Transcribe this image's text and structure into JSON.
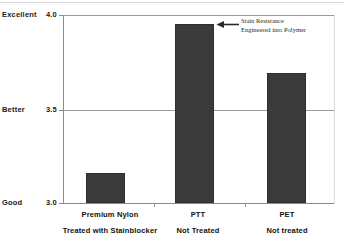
{
  "chart_data": {
    "type": "bar",
    "title": "",
    "subtitle": "",
    "xlabel": "",
    "ylabel": "",
    "ylim": [
      3.0,
      4.0
    ],
    "grid": true,
    "legend": "none",
    "categories": [
      "Premium Nylon Treated with Stainblocker",
      "PTT Not Treated",
      "PET Not treated"
    ],
    "values": [
      3.16,
      3.95,
      3.69
    ],
    "bar_color": "#3a3a3a",
    "y_ticks": [
      {
        "value": 3.0,
        "number_label": "3.0",
        "qualitative_label": "Good"
      },
      {
        "value": 3.5,
        "number_label": "3.5",
        "qualitative_label": "Better"
      },
      {
        "value": 4.0,
        "number_label": "4.0",
        "qualitative_label": "Excellent"
      }
    ],
    "category_labels": [
      {
        "line1": "Premium Nylon",
        "line2": "Treated with Stainblocker"
      },
      {
        "line1": "PTT",
        "line2": "Not Treated"
      },
      {
        "line1": "PET",
        "line2": "Not treated"
      }
    ],
    "annotations": [
      {
        "line1": "Stain Resistance",
        "line2": "Engineered into Polymer",
        "points_to": "PTT Not Treated",
        "arrow_direction": "left"
      }
    ]
  }
}
